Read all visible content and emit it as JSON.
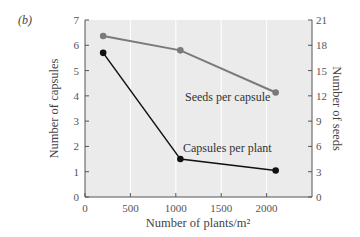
{
  "panel_label": "(b)",
  "colors": {
    "plot_bg": "#ebebeb",
    "gridline": "#ffffff",
    "axis": "#555555",
    "seeds_series": "#7a7a7a",
    "capsules_series": "#111111"
  },
  "chart_data": {
    "type": "line",
    "title": "",
    "xlabel": "Number of plants/m²",
    "ylabel_left": "Number of capsules",
    "ylabel_right": "Number of seeds",
    "xlim": [
      0,
      2500
    ],
    "ylim_left": [
      0,
      7
    ],
    "ylim_right": [
      0,
      21
    ],
    "x_ticks": [
      0,
      500,
      1000,
      1500,
      2000
    ],
    "y_ticks_left": [
      0,
      1,
      2,
      3,
      4,
      5,
      6,
      7
    ],
    "y_ticks_right": [
      0,
      3,
      6,
      9,
      12,
      15,
      18,
      21
    ],
    "grid": "vertical",
    "series": [
      {
        "name": "Seeds per capsule",
        "axis": "right",
        "x": [
          200,
          1050,
          2100
        ],
        "values": [
          19.1,
          17.4,
          12.4
        ]
      },
      {
        "name": "Capsules per plant",
        "axis": "left",
        "x": [
          200,
          1050,
          2100
        ],
        "values": [
          5.7,
          1.5,
          1.05
        ]
      }
    ]
  }
}
